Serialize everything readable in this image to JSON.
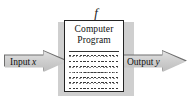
{
  "diagram": {
    "type": "flow-diagram",
    "title_label": "f",
    "box": {
      "title_line1": "Computer",
      "title_line2": "Program",
      "body_line_count": 7,
      "body_description": "wavy text lines representing program code"
    },
    "input_arrow": {
      "label": "Input",
      "variable": "x",
      "direction": "right"
    },
    "output_arrow": {
      "label": "Output",
      "variable": "y",
      "direction": "right"
    },
    "colors": {
      "arrow_fill": "#cfcfcf",
      "arrow_outline": "#6e6e6e",
      "box_border": "#222222",
      "box_fill": "#ffffff",
      "backing_fill": "#cfcfcf",
      "text": "#111111",
      "page_background": "#ffffff"
    }
  }
}
